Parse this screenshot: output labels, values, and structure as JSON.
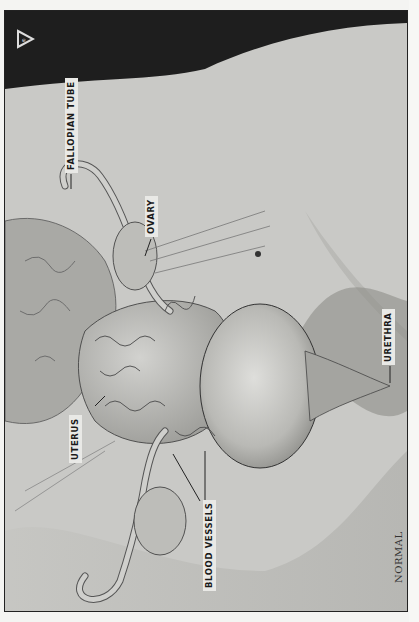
{
  "figure": {
    "caption": "NORMAL",
    "orientation": "rotated -90deg (landscape illustration on portrait page)",
    "logo": "triangle-logo-icon",
    "labels": [
      {
        "id": "fallopian_tube",
        "text": "FALLOPIAN TUBE"
      },
      {
        "id": "ovary",
        "text": "OVARY"
      },
      {
        "id": "uterus",
        "text": "UTERUS"
      },
      {
        "id": "blood_vessels",
        "text": "BLOOD VESSELS"
      },
      {
        "id": "urethra",
        "text": "URETHRA"
      }
    ],
    "colors": {
      "background_dark": "#1e1e1e",
      "tissue": "#c9c9c6",
      "frame": "#222222",
      "page": "#f4f4f2"
    }
  }
}
